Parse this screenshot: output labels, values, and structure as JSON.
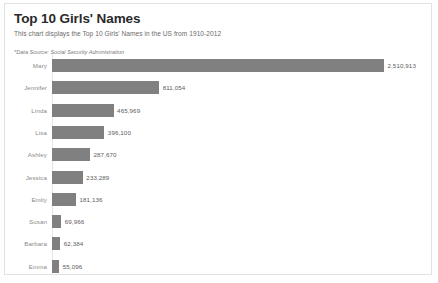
{
  "card": {
    "title": "Top 10 Girls' Names",
    "subtitle": "This chart displays the Top 10 Girls' Names in the US from 1910-2012",
    "source_note": "*Data Source: Social Security Administration"
  },
  "chart_data": {
    "type": "bar",
    "orientation": "horizontal",
    "title": "Top 10 Girls' Names",
    "subtitle": "This chart displays the Top 10 Girls' Names in the US from 1910-2012",
    "xlabel": "",
    "ylabel": "",
    "grid": false,
    "legend": "none",
    "xlim": [
      0,
      2510913
    ],
    "bar_color": "#808080",
    "categories": [
      "Mary",
      "Jennifer",
      "Linda",
      "Lisa",
      "Ashley",
      "Jessica",
      "Emily",
      "Susan",
      "Barbara",
      "Emma"
    ],
    "values": [
      2510913,
      811054,
      465969,
      396100,
      287670,
      233289,
      181136,
      69966,
      62384,
      55096
    ],
    "value_labels": [
      "2,510,913",
      "811,054",
      "465,969",
      "396,100",
      "287,670",
      "233,289",
      "181,136",
      "69,966",
      "62,384",
      "55,096"
    ]
  }
}
